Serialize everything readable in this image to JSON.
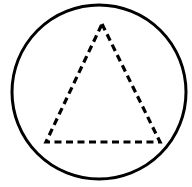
{
  "figure": {
    "background_color": "#ffffff",
    "width": 192,
    "height": 187,
    "shapes": [
      {
        "name": "circle",
        "kind": "circle",
        "stroke_color": "#000000",
        "stroke_width": 3,
        "stroke_style": "solid",
        "fill": "none",
        "center_x": 99,
        "center_y": 92,
        "radius": 87
      },
      {
        "name": "triangle",
        "kind": "polygon",
        "stroke_color": "#000000",
        "stroke_width": 3.2,
        "stroke_style": "dashed",
        "dash_length": 7,
        "gap_length": 4.5,
        "fill": "none",
        "vertices": [
          {
            "label": "apex",
            "x": 102,
            "y": 24
          },
          {
            "label": "bottom-right",
            "x": 160,
            "y": 142
          },
          {
            "label": "bottom-left",
            "x": 46,
            "y": 142
          }
        ],
        "points_attr": "102,24 160,142 46,142"
      }
    ]
  }
}
